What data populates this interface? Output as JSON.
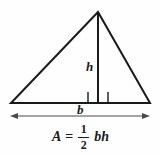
{
  "figure": {
    "name": "triangle-area-diagram",
    "background_color": "#fefefe",
    "stroke_color": "#1a1a1a",
    "text_color": "#1a1a1a"
  },
  "labels": {
    "height": "h",
    "base": "b"
  },
  "formula": {
    "full_text": "A = 1/2 bh",
    "area_symbol": "A",
    "equals": "=",
    "numerator": "1",
    "denominator": "2",
    "product": "bh"
  },
  "geometry": {
    "apex": {
      "x": 98,
      "y": 12
    },
    "left_vertex": {
      "x": 11,
      "y": 103
    },
    "right_vertex": {
      "x": 150,
      "y": 103
    },
    "altitude_foot": {
      "x": 98,
      "y": 103
    },
    "right_angle_marker": {
      "x": 88,
      "y": 92,
      "width": 20,
      "height": 11
    },
    "dimension_arrow": {
      "x1": 10,
      "x2": 150,
      "y": 116
    }
  },
  "icons": {
    "right_angle": "right-angle-marker-icon",
    "dimension_arrow": "double-headed-arrow-icon"
  }
}
